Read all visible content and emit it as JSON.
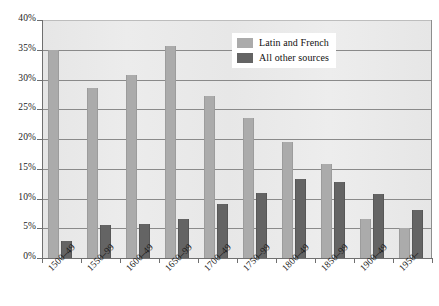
{
  "chart_data": {
    "type": "bar",
    "title": "",
    "subtitle": "",
    "xlabel": "",
    "ylabel": "",
    "ylim": [
      0,
      40
    ],
    "ytick_labels": [
      "0%",
      "5%",
      "10%",
      "15%",
      "20%",
      "25%",
      "30%",
      "35%",
      "40%"
    ],
    "ytick_values": [
      0,
      5,
      10,
      15,
      20,
      25,
      30,
      35,
      40
    ],
    "grid": true,
    "legend_position": "top-right",
    "categories": [
      "1500–49",
      "1550–99",
      "1600–49",
      "1650–99",
      "1700–49",
      "1750–99",
      "1800–49",
      "1850–99",
      "1900–49",
      "1950–"
    ],
    "series": [
      {
        "name": "Latin and French",
        "color": "#ababab",
        "values": [
          35.0,
          28.5,
          30.7,
          35.7,
          27.3,
          23.6,
          19.5,
          15.8,
          6.6,
          5.0
        ]
      },
      {
        "name": "All other sources",
        "color": "#646464",
        "values": [
          2.8,
          5.5,
          5.8,
          6.6,
          9.0,
          11.0,
          13.2,
          12.8,
          10.8,
          8.0
        ]
      }
    ]
  },
  "legend": {
    "items": [
      {
        "label": "Latin and French",
        "swatch": "light"
      },
      {
        "label": "All other sources",
        "swatch": "dark"
      }
    ]
  }
}
